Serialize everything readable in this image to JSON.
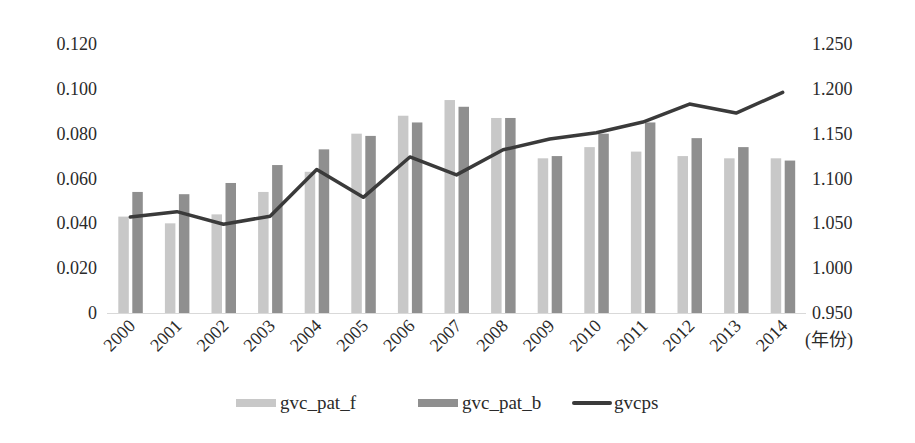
{
  "chart_data": {
    "type": "bar+line",
    "title": "",
    "categories": [
      "2000",
      "2001",
      "2002",
      "2003",
      "2004",
      "2005",
      "2006",
      "2007",
      "2008",
      "2009",
      "2010",
      "2011",
      "2012",
      "2013",
      "2014"
    ],
    "xlabel": "(年份)",
    "ylabel_left": "",
    "ylabel_right": "",
    "ylim_left": [
      0,
      0.12
    ],
    "ylim_right": [
      0.95,
      1.25
    ],
    "yticks_left": [
      "0",
      "0.020",
      "0.040",
      "0.060",
      "0.080",
      "0.100",
      "0.120"
    ],
    "yticks_right": [
      "0.950",
      "1.000",
      "1.050",
      "1.100",
      "1.150",
      "1.200",
      "1.250"
    ],
    "grid": false,
    "legend_position": "bottom",
    "series": [
      {
        "name": "gvc_pat_f",
        "type": "bar",
        "axis": "left",
        "color": "#c8c8c8",
        "values": [
          0.043,
          0.04,
          0.044,
          0.054,
          0.063,
          0.08,
          0.088,
          0.095,
          0.087,
          0.069,
          0.074,
          0.072,
          0.07,
          0.069,
          0.069
        ]
      },
      {
        "name": "gvc_pat_b",
        "type": "bar",
        "axis": "left",
        "color": "#8f8f8f",
        "values": [
          0.054,
          0.053,
          0.058,
          0.066,
          0.073,
          0.079,
          0.085,
          0.092,
          0.087,
          0.07,
          0.08,
          0.085,
          0.078,
          0.074,
          0.068
        ]
      },
      {
        "name": "gvcps",
        "type": "line",
        "axis": "right",
        "color": "#3a3a3a",
        "values": [
          1.057,
          1.063,
          1.049,
          1.058,
          1.11,
          1.079,
          1.124,
          1.104,
          1.132,
          1.144,
          1.151,
          1.163,
          1.183,
          1.173,
          1.196
        ]
      }
    ]
  },
  "legend": {
    "items": [
      {
        "label": "gvc_pat_f",
        "color": "#c8c8c8"
      },
      {
        "label": "gvc_pat_b",
        "color": "#8f8f8f"
      },
      {
        "label": "gvcps",
        "color": "#3a3a3a"
      }
    ]
  }
}
